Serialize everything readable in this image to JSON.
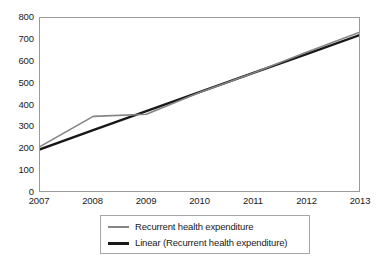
{
  "chart_data": {
    "type": "line",
    "title": "",
    "subtitle": "",
    "xlabel": "",
    "ylabel": "",
    "x": [
      2007,
      2008,
      2009,
      2010,
      2011,
      2012,
      2013
    ],
    "categories": [
      "2007",
      "2008",
      "2009",
      "2010",
      "2011",
      "2012",
      "2013"
    ],
    "xlim": [
      2007,
      2013
    ],
    "ylim": [
      0,
      800
    ],
    "y_ticks": [
      0,
      100,
      200,
      300,
      400,
      500,
      600,
      700,
      800
    ],
    "y_tick_labels": [
      "0",
      "100",
      "200",
      "300",
      "400",
      "500",
      "600",
      "700",
      "800"
    ],
    "x_tick_labels": [
      "2007",
      "2008",
      "2009",
      "2010",
      "2011",
      "2012",
      "2013"
    ],
    "grid": false,
    "legend_position": "bottom",
    "series": [
      {
        "name": "Recurrent health expenditure",
        "type": "line",
        "color": "#848484",
        "width": 1.6,
        "values": [
          205,
          345,
          355,
          455,
          545,
          640,
          733
        ]
      },
      {
        "name": "Linear (Recurrent health expenditure)",
        "type": "trendline",
        "color": "#181818",
        "width": 2.4,
        "values": [
          193,
          281,
          369,
          457,
          545,
          632,
          720
        ]
      }
    ]
  },
  "legend": {
    "entries": [
      {
        "label": "Recurrent health expenditure",
        "swatch": "series-line-swatch"
      },
      {
        "label": "Linear (Recurrent health expenditure)",
        "swatch": "trendline-swatch"
      }
    ]
  },
  "colors": {
    "series_line": "#848484",
    "trend_line": "#181818",
    "plot_border": "#9a9a9a",
    "legend_border": "#a6a6a6",
    "text": "#1a1a1a",
    "background": "#ffffff"
  }
}
